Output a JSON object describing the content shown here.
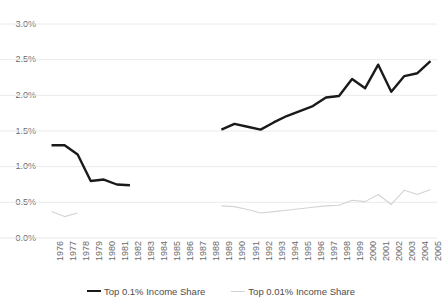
{
  "chart_data": {
    "type": "line",
    "title": "",
    "subtitle": "",
    "xlabel": "",
    "ylabel": "",
    "grid": true,
    "legend_position": "bottom",
    "ylim": [
      0.0,
      3.0
    ],
    "ytick_values": [
      0.0,
      0.5,
      1.0,
      1.5,
      2.0,
      2.5,
      3.0
    ],
    "ytick_labels": [
      "0.0%",
      "0.5%",
      "1.0%",
      "1.5%",
      "2.0%",
      "2.5%",
      "3.0%"
    ],
    "categories": [
      "1976",
      "1977",
      "1978",
      "1979",
      "1980",
      "1981",
      "1982",
      "1983",
      "1984",
      "1985",
      "1986",
      "1987",
      "1988",
      "1989",
      "1990",
      "1991",
      "1992",
      "1993",
      "1994",
      "1995",
      "1996",
      "1997",
      "1998",
      "1999",
      "2000",
      "2001",
      "2002",
      "2003",
      "2004",
      "2005"
    ],
    "series": [
      {
        "name": "Top 0.1% Income Share",
        "color": "#1a1a1a",
        "width": 2.4,
        "values": [
          1.3,
          1.3,
          1.17,
          0.8,
          0.82,
          0.75,
          0.74,
          null,
          null,
          null,
          null,
          null,
          null,
          1.52,
          1.6,
          1.56,
          1.52,
          1.62,
          1.71,
          1.78,
          1.85,
          1.97,
          1.99,
          2.23,
          2.1,
          2.43,
          2.05,
          2.27,
          2.31,
          2.48
        ]
      },
      {
        "name": "Top 0.01% Income Share",
        "color": "#d3d3d3",
        "width": 1.1,
        "values": [
          0.37,
          0.3,
          0.35,
          null,
          null,
          null,
          null,
          null,
          null,
          null,
          null,
          null,
          null,
          0.45,
          0.44,
          0.4,
          0.35,
          0.37,
          0.39,
          0.41,
          0.43,
          0.45,
          0.46,
          0.53,
          0.51,
          0.61,
          0.47,
          0.67,
          0.61,
          0.68
        ]
      }
    ]
  },
  "legend": {
    "entries": [
      {
        "label": "Top 0.1% Income Share"
      },
      {
        "label": "Top 0.01% Income Share"
      }
    ]
  },
  "colors": {
    "primary_series": "#1a1a1a",
    "secondary_series": "#d3d3d3",
    "gridline": "#e8e8e8",
    "axis_text": "#6a6a6a",
    "legend_text": "#4d4d4d",
    "background": "#ffffff"
  }
}
